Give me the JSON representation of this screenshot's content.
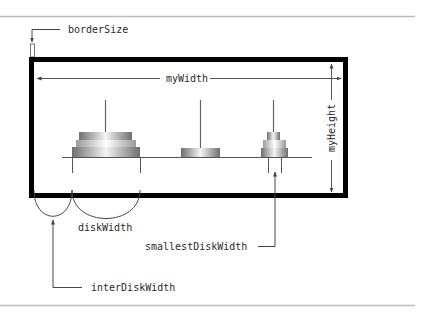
{
  "diagram": {
    "labels": {
      "border_size": "borderSize",
      "my_width": "myWidth",
      "my_height": "myHeight",
      "disk_width": "diskWidth",
      "smallest_disk_width": "smallestDiskWidth",
      "inter_disk_width": "interDiskWidth"
    },
    "colors": {
      "frame": "#000000",
      "rule": "#b4b4b4",
      "arrow": "#555555",
      "pole": "#666666",
      "disk_dark": "#7a7a7a",
      "disk_light": "#f2f2f2",
      "disk_mid": "#b8b8b8"
    },
    "towers": [
      {
        "name": "tower-1",
        "disk_count": 3
      },
      {
        "name": "tower-2",
        "disk_count": 1
      },
      {
        "name": "tower-3",
        "disk_count": 3
      }
    ]
  }
}
